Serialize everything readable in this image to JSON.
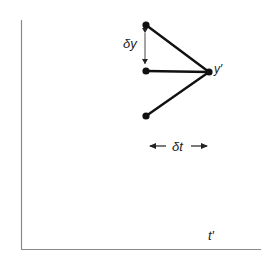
{
  "diagram": {
    "type": "stencil-diagram",
    "axes": {
      "x_label": "t′",
      "color": "#8a8a8a"
    },
    "labels": {
      "delta_y": "δy",
      "delta_t": "δt",
      "target_node": "y′"
    },
    "nodes": [
      {
        "id": "top-left",
        "x": 146,
        "y": 25
      },
      {
        "id": "mid-left",
        "x": 146,
        "y": 71
      },
      {
        "id": "bottom-left",
        "x": 146,
        "y": 116
      },
      {
        "id": "target",
        "x": 209,
        "y": 72
      }
    ],
    "edges": [
      {
        "from": "top-left",
        "to": "target"
      },
      {
        "from": "mid-left",
        "to": "target"
      },
      {
        "from": "bottom-left",
        "to": "target"
      }
    ],
    "line_color": "#111111"
  }
}
